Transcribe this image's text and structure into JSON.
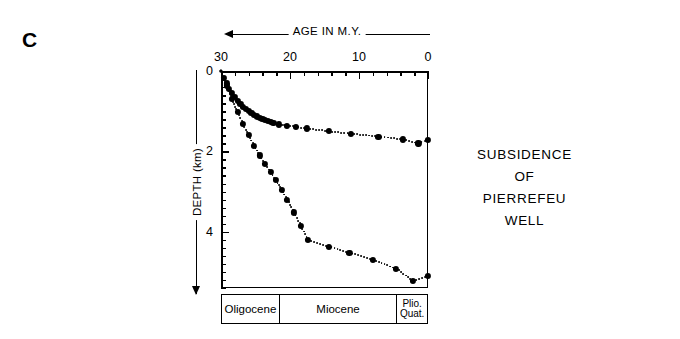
{
  "figure": {
    "panel_label": "C",
    "title_lines": [
      "SUBSIDENCE",
      "OF",
      "PIERREFEU",
      "WELL"
    ]
  },
  "axes": {
    "x": {
      "caption": "AGE IN M.Y.",
      "arrow": "left-arrow-icon",
      "tick_labels": [
        "30",
        "20",
        "10",
        "0"
      ],
      "tick_values": [
        30,
        20,
        10,
        0
      ],
      "range": [
        30,
        0
      ],
      "reversed": true,
      "minor_step": 2
    },
    "y": {
      "caption": "DEPTH (km)",
      "arrow": "down-arrow-icon",
      "tick_labels": [
        "0",
        "2",
        "4"
      ],
      "tick_values": [
        0,
        2,
        4
      ],
      "range": [
        0,
        5.4
      ],
      "minor_step": 0.2
    }
  },
  "stratigraphy": [
    {
      "label": "Oligocene",
      "start_age": 30.0,
      "end_age": 21.6,
      "multiline": false
    },
    {
      "label": "Miocene",
      "start_age": 21.6,
      "end_age": 4.4,
      "multiline": false
    },
    {
      "label": "Plio.\nQuat.",
      "line1": "Plio.",
      "line2": "Quat.",
      "start_age": 4.4,
      "end_age": 0.0,
      "multiline": true
    }
  ],
  "chart_data": {
    "type": "scatter",
    "xlabel": "AGE IN M.Y.",
    "ylabel": "DEPTH (km)",
    "xlim": [
      30,
      0
    ],
    "ylim": [
      0,
      5.4
    ],
    "x_reversed": true,
    "y_inverted": true,
    "grid": false,
    "legend": "none",
    "marker_style": "filled-circle",
    "line_style": "dotted",
    "series": [
      {
        "name": "tectonic-subsidence-curve",
        "x": [
          30.0,
          29.6,
          29.2,
          28.8,
          28.4,
          28.0,
          27.6,
          27.2,
          26.8,
          26.4,
          26.0,
          25.6,
          25.2,
          24.8,
          24.4,
          24.0,
          23.6,
          23.2,
          22.8,
          22.4,
          21.6,
          20.4,
          19.2,
          17.6,
          14.4,
          11.2,
          7.2,
          3.6,
          1.4,
          0.0
        ],
        "y": [
          0.0,
          0.17,
          0.31,
          0.44,
          0.55,
          0.65,
          0.74,
          0.82,
          0.89,
          0.95,
          1.0,
          1.05,
          1.09,
          1.13,
          1.16,
          1.19,
          1.22,
          1.25,
          1.27,
          1.29,
          1.33,
          1.36,
          1.39,
          1.43,
          1.5,
          1.56,
          1.63,
          1.7,
          1.8,
          1.72
        ]
      },
      {
        "name": "total-subsidence-curve",
        "x": [
          30.0,
          29.2,
          28.4,
          27.6,
          26.8,
          26.0,
          25.2,
          24.4,
          23.6,
          22.8,
          22.0,
          21.2,
          20.4,
          19.4,
          18.4,
          17.4,
          14.4,
          11.4,
          8.0,
          4.6,
          2.2,
          0.0
        ],
        "y": [
          0.0,
          0.36,
          0.7,
          1.02,
          1.32,
          1.6,
          1.86,
          2.1,
          2.32,
          2.52,
          2.72,
          2.95,
          3.2,
          3.52,
          3.86,
          4.2,
          4.37,
          4.52,
          4.7,
          4.92,
          5.22,
          5.1
        ]
      }
    ]
  },
  "colors": {
    "ink": "#000000",
    "background": "#ffffff"
  }
}
